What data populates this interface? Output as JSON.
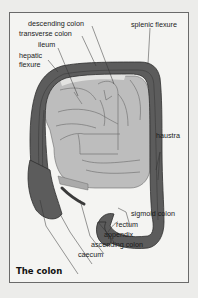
{
  "figure": {
    "caption": "The colon",
    "labels": {
      "descending_colon": "descending colon",
      "transverse_colon": "transverse colon",
      "ileum": "ileum",
      "hepatic_flexure_1": "hepatic",
      "hepatic_flexure_2": "flexure",
      "splenic_flexure": "splenic flexure",
      "haustra": "haustra",
      "sigmoid_colon": "sigmoid colon",
      "rectum": "rectum",
      "appendix": "appendix",
      "ascending_colon": "ascending colon",
      "caecum": "caecum"
    },
    "colors": {
      "background": "#ececea",
      "frame_fill": "#f4f4f2",
      "frame_border": "#6a6a6a",
      "colon": "#5c5c5c",
      "small_intestine": "#bdbdbd",
      "text": "#1a1a1a"
    }
  }
}
